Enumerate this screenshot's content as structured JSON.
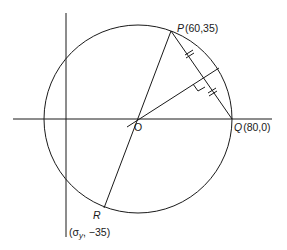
{
  "diagram": {
    "type": "Mohr's circle construction",
    "stroke_color": "#1a1a1a",
    "background": "#ffffff",
    "points": {
      "P": {
        "name": "P",
        "coords": "(60,35)"
      },
      "Q": {
        "name": "Q",
        "coords": "(80,0)"
      },
      "R": {
        "name": "R",
        "coords": "(σ",
        "coords_sub": "y",
        "coords_tail": ", −35)"
      },
      "O": {
        "name": "O"
      }
    },
    "annotations": {
      "equal_segments": "tick marks on PQ halves",
      "right_angle": "perpendicular bisector of PQ through O"
    }
  }
}
